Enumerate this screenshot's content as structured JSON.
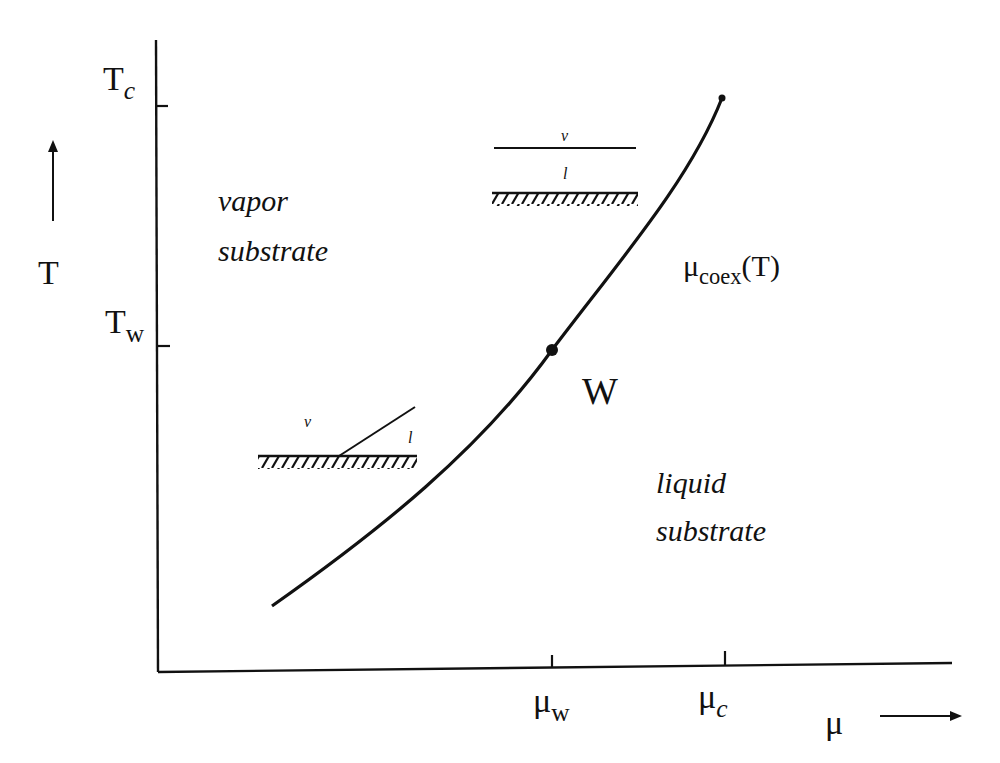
{
  "diagram": {
    "type": "surface phase diagram (wetting transition)",
    "axes": {
      "y_label": "T",
      "x_label": "μ",
      "y_ticks": [
        {
          "base": "T",
          "sub": "c",
          "sub_italic": true
        },
        {
          "base": "T",
          "sub": "w",
          "sub_italic": false
        }
      ],
      "x_ticks": [
        {
          "base": "μ",
          "sub": "w",
          "sub_italic": false
        },
        {
          "base": "μ",
          "sub": "c",
          "sub_italic": true
        }
      ]
    },
    "curve": {
      "label_base": "μ",
      "label_sub": "coex",
      "label_tail": "(T)",
      "wetting_point_label": "W"
    },
    "regions": {
      "upper_left": [
        "vapor",
        "substrate"
      ],
      "lower_right": [
        "liquid",
        "substrate"
      ]
    },
    "insets": {
      "wet": {
        "top_label": "v",
        "film_label": "l"
      },
      "partial": {
        "vapor_label": "v",
        "droplet_label": "l"
      }
    }
  }
}
